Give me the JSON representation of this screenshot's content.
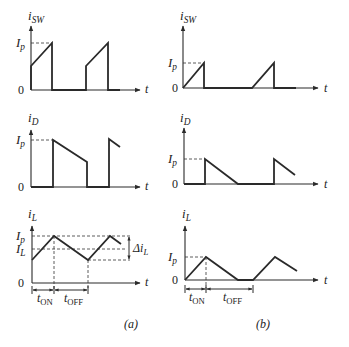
{
  "colors": {
    "stroke": "#2a2a2a",
    "dash": "#333333",
    "text": "#222222",
    "background": "#ffffff"
  },
  "panels": [
    {
      "id": "a",
      "caption": "(a)",
      "caption_pos": [
        124,
        328
      ],
      "plots": [
        {
          "name": "i-sw-plot-a",
          "ylabel": "i",
          "ylabel_sub": "SW",
          "ylabel_pos": [
            28,
            20
          ],
          "axis": {
            "x0": 31,
            "y0": 90,
            "ytop": 26,
            "xend": 140
          },
          "t_label": "t",
          "t_pos": [
            145,
            93
          ],
          "zero_label": "0",
          "zero_pos": [
            18,
            94
          ],
          "levels": [
            {
              "label": "I",
              "sub": "p",
              "y": 43,
              "pos": [
                16,
                47
              ]
            }
          ],
          "trace": [
            [
              31,
              90
            ],
            [
              31,
              66
            ],
            [
              52,
              43
            ],
            [
              52,
              90
            ],
            [
              86,
              90
            ],
            [
              86,
              66
            ],
            [
              108,
              43
            ],
            [
              108,
              90
            ],
            [
              120,
              90
            ]
          ],
          "dashes": [
            [
              [
                31,
                43
              ],
              [
                52,
                43
              ]
            ]
          ]
        },
        {
          "name": "i-d-plot-a",
          "ylabel": "i",
          "ylabel_sub": "D",
          "ylabel_pos": [
            28,
            122
          ],
          "axis": {
            "x0": 31,
            "y0": 187,
            "ytop": 130,
            "xend": 140
          },
          "t_label": "t",
          "t_pos": [
            145,
            190
          ],
          "zero_label": "0",
          "zero_pos": [
            18,
            191
          ],
          "levels": [
            {
              "label": "I",
              "sub": "p",
              "y": 140,
              "pos": [
                16,
                144
              ]
            }
          ],
          "trace": [
            [
              31,
              187
            ],
            [
              31,
              187
            ],
            [
              53,
              187
            ],
            [
              53,
              140
            ],
            [
              87,
              162
            ],
            [
              87,
              187
            ],
            [
              109,
              187
            ],
            [
              109,
              139
            ],
            [
              120,
              147
            ]
          ],
          "dashes": [
            [
              [
                31,
                140
              ],
              [
                53,
                140
              ]
            ]
          ]
        },
        {
          "name": "i-l-plot-a",
          "ylabel": "i",
          "ylabel_sub": "L",
          "ylabel_pos": [
            28,
            218
          ],
          "axis": {
            "x0": 32,
            "y0": 283,
            "ytop": 226,
            "xend": 140
          },
          "t_label": "t",
          "t_pos": [
            145,
            286
          ],
          "zero_label": "0",
          "zero_pos": [
            18,
            287
          ],
          "levels": [
            {
              "label": "I",
              "sub": "p",
              "y": 236,
              "pos": [
                16,
                240
              ]
            },
            {
              "label": "I",
              "sub": "L",
              "y": 249,
              "pos": [
                16,
                253
              ]
            }
          ],
          "trace": [
            [
              32,
              260
            ],
            [
              54,
              236
            ],
            [
              88,
              260
            ],
            [
              110,
              236
            ],
            [
              121,
              244
            ]
          ],
          "dashes": [
            [
              [
                32,
                236
              ],
              [
                130,
                236
              ]
            ],
            [
              [
                32,
                249
              ],
              [
                126,
                249
              ]
            ],
            [
              [
                88,
                260
              ],
              [
                130,
                260
              ]
            ],
            [
              [
                54,
                236
              ],
              [
                54,
                290
              ]
            ],
            [
              [
                88,
                260
              ],
              [
                88,
                290
              ]
            ]
          ],
          "delta": {
            "label": "Δi",
            "sub": "L",
            "x": 129,
            "y1": 236,
            "y2": 260,
            "pos": [
              133,
              252
            ]
          },
          "timing": {
            "y": 290,
            "ticks": [
              32,
              54,
              88
            ],
            "labels": [
              {
                "t": "t",
                "sub": "ON",
                "pos": [
                  37,
                  305
                ]
              },
              {
                "t": "t",
                "sub": "OFF",
                "pos": [
                  64,
                  305
                ]
              }
            ]
          }
        }
      ]
    },
    {
      "id": "b",
      "caption": "(b)",
      "caption_pos": [
        256,
        328
      ],
      "plots": [
        {
          "name": "i-sw-plot-b",
          "ylabel": "i",
          "ylabel_sub": "SW",
          "ylabel_pos": [
            180,
            20
          ],
          "axis": {
            "x0": 183,
            "y0": 88,
            "ytop": 26,
            "xend": 318
          },
          "t_label": "t",
          "t_pos": [
            324,
            92
          ],
          "zero_label": "0",
          "zero_pos": [
            172,
            92
          ],
          "levels": [
            {
              "label": "I",
              "sub": "p",
              "y": 63,
              "pos": [
                168,
                67
              ]
            }
          ],
          "trace": [
            [
              183,
              88
            ],
            [
              204,
              63
            ],
            [
              204,
              88
            ],
            [
              252,
              88
            ],
            [
              274,
              63
            ],
            [
              274,
              88
            ],
            [
              296,
              88
            ]
          ],
          "dashes": [
            [
              [
                183,
                63
              ],
              [
                204,
                63
              ]
            ]
          ]
        },
        {
          "name": "i-d-plot-b",
          "ylabel": "i",
          "ylabel_sub": "D",
          "ylabel_pos": [
            180,
            122
          ],
          "axis": {
            "x0": 184,
            "y0": 184,
            "ytop": 128,
            "xend": 318
          },
          "t_label": "t",
          "t_pos": [
            324,
            188
          ],
          "zero_label": "0",
          "zero_pos": [
            172,
            188
          ],
          "levels": [
            {
              "label": "I",
              "sub": "p",
              "y": 159,
              "pos": [
                168,
                163
              ]
            }
          ],
          "trace": [
            [
              184,
              184
            ],
            [
              205,
              184
            ],
            [
              205,
              159
            ],
            [
              238,
              184
            ],
            [
              274,
              184
            ],
            [
              274,
              159
            ],
            [
              295,
              175
            ]
          ],
          "dashes": [
            [
              [
                184,
                159
              ],
              [
                205,
                159
              ]
            ]
          ]
        },
        {
          "name": "i-l-plot-b",
          "ylabel": "i",
          "ylabel_sub": "L",
          "ylabel_pos": [
            182,
            218
          ],
          "axis": {
            "x0": 185,
            "y0": 280,
            "ytop": 226,
            "xend": 318
          },
          "t_label": "t",
          "t_pos": [
            324,
            284
          ],
          "zero_label": "0",
          "zero_pos": [
            172,
            284
          ],
          "levels": [
            {
              "label": "I",
              "sub": "p",
              "y": 257,
              "pos": [
                168,
                261
              ]
            }
          ],
          "trace": [
            [
              185,
              280
            ],
            [
              206,
              257
            ],
            [
              238,
              280
            ],
            [
              253,
              280
            ],
            [
              275,
              257
            ],
            [
              297,
              271
            ]
          ],
          "dashes": [
            [
              [
                185,
                257
              ],
              [
                206,
                257
              ]
            ],
            [
              [
                206,
                257
              ],
              [
                206,
                290
              ]
            ]
          ],
          "timing": {
            "y": 289,
            "ticks": [
              185,
              206,
              253
            ],
            "labels": [
              {
                "t": "t",
                "sub": "ON",
                "pos": [
                  189,
                  304
                ]
              },
              {
                "t": "t",
                "sub": "OFF",
                "pos": [
                  223,
                  304
                ]
              }
            ]
          }
        }
      ]
    }
  ]
}
